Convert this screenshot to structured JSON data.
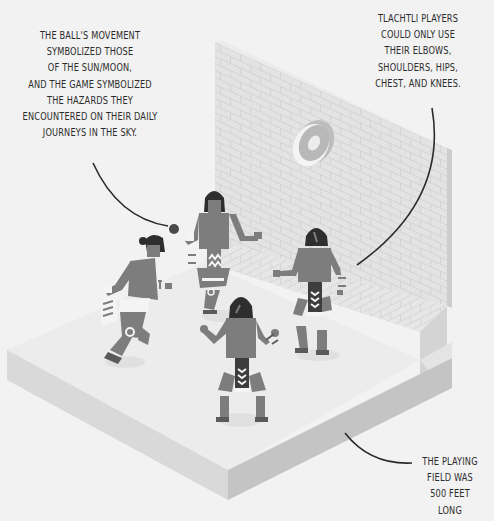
{
  "illustration": {
    "subject": "Tlachtli ball game court with four players",
    "palette": {
      "background": "#f2f2f2",
      "floor_top": "#ececec",
      "floor_left_side": "#d6d6d6",
      "floor_right_side": "#c4c4c4",
      "wall_face": "#e2e2e2",
      "wall_brick_line": "#d2d2d2",
      "wall_edge": "#cfcfcf",
      "hoop": "#bdbdbd",
      "hoop_rim": "#e6e6e6",
      "player_body": "#7d7d7d",
      "player_hair": "#2e2e2e",
      "player_loincloth": "#3d3d3d",
      "ball": "#4a4a4a",
      "callout_line": "#2b2b2b"
    },
    "elements": [
      "brick-wall",
      "stone-ring-hoop",
      "court-floor",
      "ball",
      "player-1",
      "player-2",
      "player-3",
      "player-4"
    ]
  },
  "callouts": {
    "ball": {
      "lines": [
        "THE BALL'S MOVEMENT",
        "SYMBOLIZED THOSE",
        "OF THE SUN/MOON,",
        "AND THE GAME SYMBOLIZED",
        "THE HAZARDS THEY",
        "ENCOUNTERED ON THEIR DAILY",
        "JOURNEYS IN THE SKY."
      ]
    },
    "players": {
      "lines": [
        "TLACHTLI PLAYERS",
        "COULD ONLY USE",
        "THEIR ELBOWS,",
        "SHOULDERS, HIPS,",
        "CHEST, AND KNEES."
      ]
    },
    "field": {
      "lines": [
        "THE PLAYING",
        "FIELD WAS",
        "500 FEET",
        "LONG"
      ]
    }
  }
}
